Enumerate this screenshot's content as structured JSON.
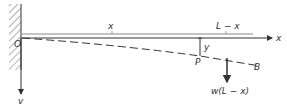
{
  "diagram": {
    "labels": {
      "origin": "O",
      "x_dim": "x",
      "remaining_length": "L − x",
      "x_axis": "x",
      "y_axis": "v",
      "deflection": "y",
      "point_p": "P",
      "point_b": "B",
      "load": "w(L − x)"
    },
    "colors": {
      "line": "#333333",
      "hatch": "#555555",
      "beam": "#666666"
    }
  }
}
